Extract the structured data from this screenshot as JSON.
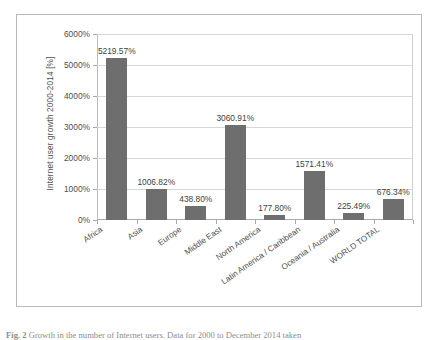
{
  "chart_data": {
    "type": "bar",
    "title": "",
    "xlabel": "",
    "ylabel": "Internet user growth 2000-2014 [%]",
    "ylim": [
      0,
      6000
    ],
    "ytick_labels": [
      "6000%",
      "5000%",
      "4000%",
      "3000%",
      "2000%",
      "1000%",
      "0%"
    ],
    "ytick_values": [
      6000,
      5000,
      4000,
      3000,
      2000,
      1000,
      0
    ],
    "grid": true,
    "legend": "none",
    "bar_color": "#6e6e6e",
    "categories": [
      "Africa",
      "Asia",
      "Europe",
      "Middle East",
      "North America",
      "Latin America / Caribbean",
      "Oceania / Australia",
      "WORLD TOTAL"
    ],
    "values": [
      5219.57,
      1006.82,
      438.8,
      3060.91,
      177.8,
      1571.41,
      225.49,
      676.34
    ],
    "data_labels": [
      "5219.57%",
      "1006.82%",
      "438.80%",
      "3060.91%",
      "177.80%",
      "1571.41%",
      "225.49%",
      "676.34%"
    ]
  },
  "caption": {
    "figure_label": "Fig. 2",
    "text": "Growth in the number of Internet users. Data for 2000 to December 2014 taken"
  }
}
